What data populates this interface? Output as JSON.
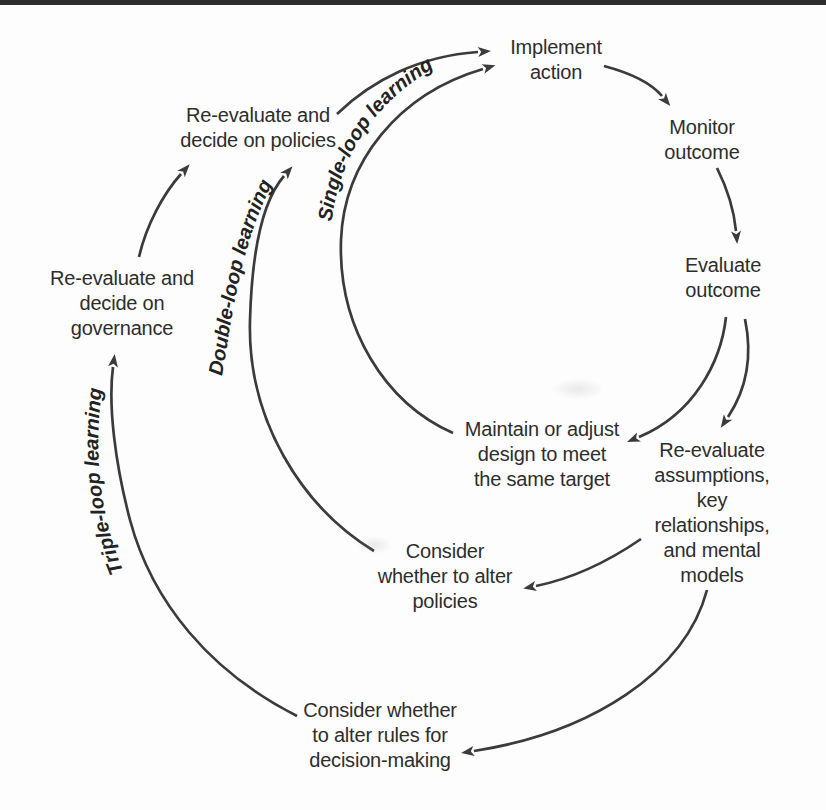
{
  "page": {
    "background": "#fdfdfd",
    "top_bar_color": "#2d2d2d",
    "text_color": "#2d2d2d",
    "arrow_color": "#3b3b3b"
  },
  "diagram": {
    "nodes": {
      "implement_action": "Implement\naction",
      "monitor_outcome": "Monitor\noutcome",
      "evaluate_outcome": "Evaluate\noutcome",
      "maintain_design": "Maintain or adjust\ndesign to meet\nthe same target",
      "reevaluate_assumptions": "Re-evaluate\nassumptions,\nkey relationships,\nand mental\nmodels",
      "consider_policies": "Consider\nwhether to alter\npolicies",
      "consider_rules": "Consider whether\nto alter rules for\ndecision-making",
      "reevaluate_policies": "Re-evaluate and\ndecide on policies",
      "reevaluate_governance": "Re-evaluate and\ndecide on\ngovernance"
    },
    "loop_labels": {
      "single": "Single-loop learning",
      "double": "Double-loop learning",
      "triple": "Triple-loop learning"
    }
  }
}
